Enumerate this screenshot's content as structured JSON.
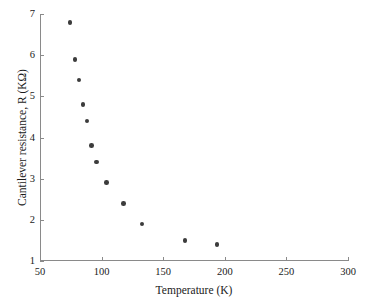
{
  "chart_data": {
    "type": "scatter",
    "title": "",
    "xlabel": "Temperature (K)",
    "ylabel": "Cantilever resistance, R (KΩ)",
    "xlim": [
      50,
      300
    ],
    "ylim": [
      1,
      7
    ],
    "xticks": [
      50,
      100,
      150,
      200,
      250,
      300
    ],
    "yticks": [
      1,
      2,
      3,
      4,
      5,
      6,
      7
    ],
    "xtick_labels": [
      "50",
      "100",
      "150",
      "200",
      "250",
      "300"
    ],
    "ytick_labels": [
      "1",
      "2",
      "3",
      "4",
      "5",
      "6",
      "7"
    ],
    "grid": false,
    "legend": null,
    "marker": {
      "shape": "circle",
      "color": "#3c3c3c",
      "size": 4.6
    },
    "frame": {
      "left_spine": true,
      "bottom_spine": true,
      "top_spine": false,
      "right_spine": false,
      "spine_color": "#8a8a8a",
      "tick_direction": "in"
    },
    "series": [
      {
        "name": "Cantilever resistance vs temperature",
        "x": [
          73.5,
          77.5,
          81.0,
          84.0,
          87.5,
          91.0,
          95.0,
          103.0,
          117.0,
          132.0,
          167.0,
          193.0
        ],
        "y": [
          6.8,
          5.9,
          5.4,
          4.8,
          4.4,
          3.8,
          3.4,
          2.9,
          2.4,
          1.9,
          1.5,
          1.4
        ]
      }
    ]
  }
}
